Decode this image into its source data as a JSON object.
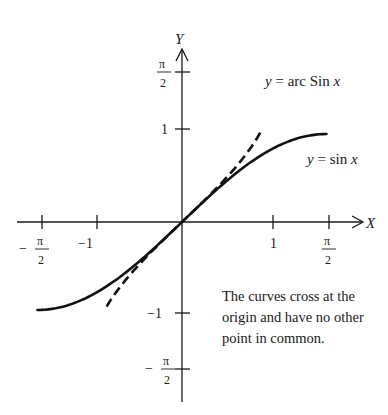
{
  "chart_data": {
    "type": "line",
    "title": "",
    "xlabel": "X",
    "ylabel": "Y",
    "xlim": [
      -1.7,
      1.85
    ],
    "ylim": [
      -1.95,
      1.9
    ],
    "grid": false,
    "x_ticks": [
      {
        "value": -1.5708,
        "label_num": "π",
        "label_den": "2",
        "label_sign": "−"
      },
      {
        "value": -1,
        "label": "−1"
      },
      {
        "value": 1,
        "label": "1"
      },
      {
        "value": 1.5708,
        "label_num": "π",
        "label_den": "2",
        "label_sign": ""
      }
    ],
    "y_ticks": [
      {
        "value": 1.5708,
        "label_num": "π",
        "label_den": "2",
        "label_sign": ""
      },
      {
        "value": 1,
        "label": "1"
      },
      {
        "value": -1,
        "label": "−1"
      },
      {
        "value": -1.5708,
        "label_num": "π",
        "label_den": "2",
        "label_sign": "−"
      }
    ],
    "series": [
      {
        "name": "y = sin x",
        "style": "solid",
        "x": [
          -1.5708,
          -1.2,
          -0.8,
          -0.4,
          0,
          0.4,
          0.8,
          1.2,
          1.5708
        ],
        "y": [
          -1.0,
          -0.932,
          -0.717,
          -0.389,
          0,
          0.389,
          0.717,
          0.932,
          1.0
        ]
      },
      {
        "name": "y = arc Sin x",
        "style": "dashed",
        "x": [
          -0.82,
          -0.6,
          -0.4,
          -0.2,
          0,
          0.2,
          0.4,
          0.6,
          0.86
        ],
        "y": [
          -0.96,
          -0.644,
          -0.412,
          -0.201,
          0,
          0.201,
          0.412,
          0.644,
          1.035
        ]
      }
    ],
    "annotations": [
      {
        "text": "y = arc Sin x",
        "near": "dashed curve top"
      },
      {
        "text": "y = sin x",
        "near": "solid curve right"
      }
    ]
  },
  "labels": {
    "y_axis": "Y",
    "x_axis": "X",
    "arcsin_label_prefix": "y",
    "arcsin_label_middle": " = arc Sin ",
    "arcsin_label_suffix": "x",
    "sin_label_prefix": "y",
    "sin_label_middle": " = sin ",
    "sin_label_suffix": "x",
    "pi": "π",
    "two": "2",
    "one": "1",
    "minus_one": "−1",
    "minus": "−"
  },
  "note": "The curves cross at the origin and have no other point in common."
}
